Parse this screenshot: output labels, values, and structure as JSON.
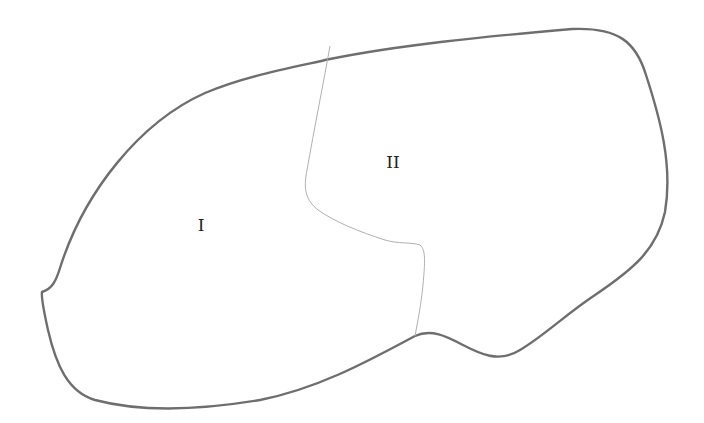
{
  "diagram": {
    "regions": [
      {
        "id": "region-1",
        "label": "I",
        "x": 201,
        "y": 225
      },
      {
        "id": "region-2",
        "label": "II",
        "x": 393,
        "y": 162
      }
    ],
    "colors": {
      "outline": "#6e6e6e",
      "divider": "#b0b0b0",
      "background": "#ffffff",
      "text": "#222222"
    }
  }
}
